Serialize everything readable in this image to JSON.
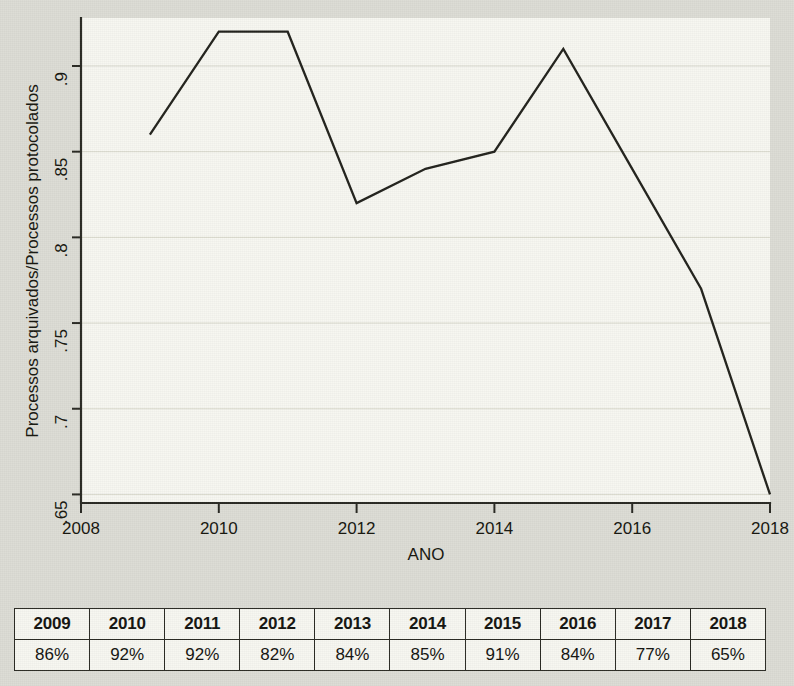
{
  "chart_data": {
    "type": "line",
    "title": "",
    "xlabel": "ANO",
    "ylabel": "Processos arquivados/Processos protocolados",
    "x": [
      2009,
      2010,
      2011,
      2012,
      2013,
      2014,
      2015,
      2016,
      2017,
      2018
    ],
    "values": [
      0.86,
      0.92,
      0.92,
      0.82,
      0.84,
      0.85,
      0.91,
      0.84,
      0.77,
      0.65
    ],
    "series": [
      {
        "name": "Processos arquivados/Processos protocolados",
        "values": [
          0.86,
          0.92,
          0.92,
          0.82,
          0.84,
          0.85,
          0.91,
          0.84,
          0.77,
          0.65
        ]
      }
    ],
    "xlim": [
      2008,
      2018
    ],
    "ylim": [
      0.645,
      0.928
    ],
    "xticks": [
      2008,
      2010,
      2012,
      2014,
      2016,
      2018
    ],
    "xtick_labels": [
      "2008",
      "2010",
      "2012",
      "2014",
      "2016",
      "2018"
    ],
    "yticks": [
      0.65,
      0.7,
      0.75,
      0.8,
      0.85,
      0.9
    ],
    "ytick_labels": [
      ".65",
      ".7",
      ".75",
      ".8",
      ".85",
      ".9"
    ],
    "grid": true,
    "grid_axis": "y",
    "legend": false,
    "legend_position": "none",
    "line_color": "#23231d",
    "plot_background": "#f7f7f1",
    "figure_background": "#dcdcd5"
  },
  "axes": {
    "y_title": "Processos arquivados/Processos protocolados",
    "x_title": "ANO",
    "y_tick_labels": [
      ".9",
      ".85",
      ".8",
      ".75",
      ".7",
      ".65"
    ],
    "x_tick_labels": [
      "2008",
      "2010",
      "2012",
      "2014",
      "2016",
      "2018"
    ]
  },
  "table": {
    "headers": [
      "2009",
      "2010",
      "2011",
      "2012",
      "2013",
      "2014",
      "2015",
      "2016",
      "2017",
      "2018"
    ],
    "values": [
      "86%",
      "92%",
      "92%",
      "82%",
      "84%",
      "85%",
      "91%",
      "84%",
      "77%",
      "65%"
    ]
  }
}
